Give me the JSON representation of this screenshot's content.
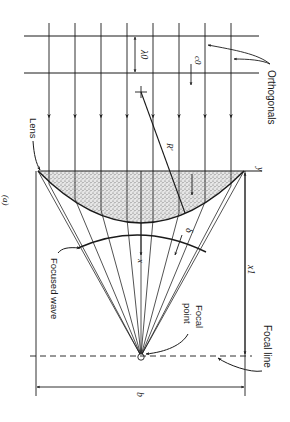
{
  "figure": {
    "panel_label": "(a)",
    "orientation": "rotated 90° clockwise",
    "background": "#ffffff",
    "ink": "#1a1a1a",
    "lens_fill": "#c8c8c8"
  },
  "labels": {
    "orthogonals": "Orthogonals",
    "lens": "Lens",
    "focused_wave": "Focused wave",
    "focal_point_line1": "Focal",
    "focal_point_line2": "point",
    "focal_line": "Focal line",
    "y_axis": "y",
    "x_axis": "x",
    "radius": "R'",
    "wavelength": "λ0",
    "celerity": "c0",
    "delta": "δ",
    "focal_distance": "x1",
    "width": "b"
  },
  "geometry": {
    "orthogonal_x": [
      49,
      75,
      101,
      127,
      153,
      179,
      205,
      231
    ],
    "crest_y": [
      36,
      73
    ],
    "lens_top_y": 171,
    "lens_left_x": 38,
    "lens_right_x": 244,
    "lens_bottom_y": 221,
    "focal_point": [
      141,
      356
    ],
    "focal_line_y": 356,
    "boundary_x": [
      36,
      245
    ],
    "b_line_y": 387
  }
}
